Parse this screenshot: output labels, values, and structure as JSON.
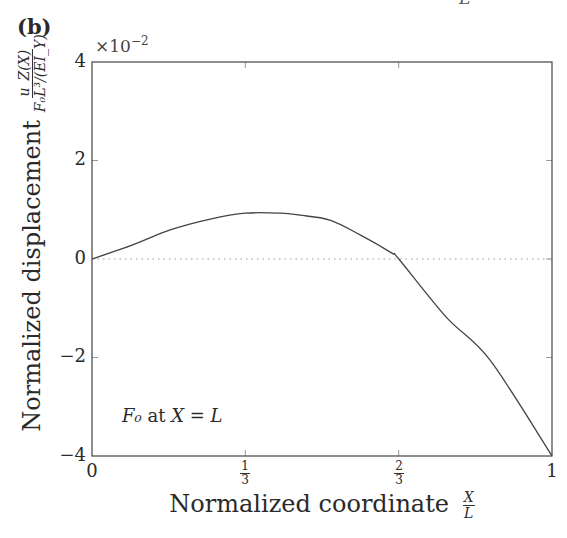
{
  "chart_data": {
    "type": "line",
    "panel_label": "(b)",
    "title": "",
    "xlabel": "Normalized coordinate X/L",
    "ylabel": "Normalized displacement u_Z(X) / (F_0 L^3/(E I_Y))",
    "y_scale_factor": "×10^-2",
    "xlim": [
      0,
      1
    ],
    "ylim": [
      -4,
      4
    ],
    "x_ticks": [
      "0",
      "1/3",
      "2/3",
      "1"
    ],
    "y_ticks": [
      "-4",
      "-2",
      "0",
      "2",
      "4"
    ],
    "grid": false,
    "reference_line": {
      "y": 0,
      "style": "dotted"
    },
    "annotation": "F_0 at X = L",
    "series": [
      {
        "name": "u_Z(X) normalized",
        "x": [
          0,
          0.087,
          0.17,
          0.257,
          0.333,
          0.41,
          0.452,
          0.517,
          0.583,
          0.652,
          0.667,
          0.77,
          0.865,
          1.0
        ],
        "values": [
          0,
          0.28,
          0.59,
          0.81,
          0.93,
          0.93,
          0.89,
          0.79,
          0.49,
          0.12,
          0,
          -1.18,
          -2.05,
          -4.0
        ]
      }
    ]
  },
  "labels": {
    "panel": "(b)",
    "cut_top": "L",
    "exp_base": "×10",
    "exp_power": "−2",
    "ylabel_text": "Normalized displacement",
    "ylabel_num": "u_Z(X)",
    "ylabel_den": "F₀L³/(EI_Y)",
    "xlabel_text": "Normalized coordinate",
    "xlabel_num": "X",
    "xlabel_den": "L",
    "annot_a": "F₀",
    "annot_b": " at ",
    "annot_c": "X = L",
    "yticks": [
      "4",
      "2",
      "0",
      "−2",
      "−4"
    ],
    "xticks": [
      "0",
      "1",
      "1"
    ],
    "xfrac_one_third": {
      "num": "1",
      "den": "3"
    },
    "xfrac_two_third": {
      "num": "2",
      "den": "3"
    }
  }
}
